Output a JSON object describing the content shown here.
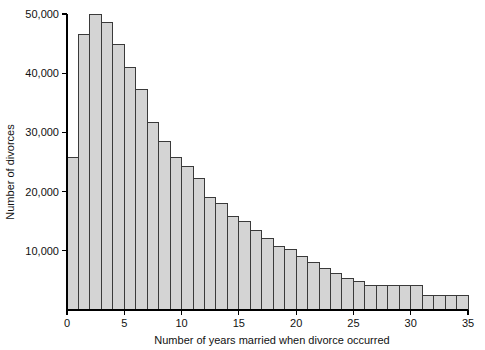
{
  "chart_data": {
    "type": "bar",
    "title": "",
    "subtitle": "",
    "xlabel": "Number of years married when divorce occurred",
    "ylabel": "Number of divorces",
    "xlim": [
      0,
      35
    ],
    "ylim": [
      0,
      50000
    ],
    "grid": false,
    "legend": null,
    "x_ticks": [
      0,
      5,
      10,
      15,
      20,
      25,
      30,
      35
    ],
    "x_tick_labels": [
      "0",
      "5",
      "10",
      "15",
      "20",
      "25",
      "30",
      "35"
    ],
    "y_ticks": [
      10000,
      20000,
      30000,
      40000,
      50000
    ],
    "y_tick_labels": [
      "10,000",
      "20,000",
      "30,000",
      "40,000",
      "50,000"
    ],
    "bar_fill": "#d4d4d4",
    "bar_edge": "#3a3a3a",
    "bins": [
      {
        "start": 0,
        "end": 1,
        "value": 25800
      },
      {
        "start": 1,
        "end": 2,
        "value": 46500
      },
      {
        "start": 2,
        "end": 3,
        "value": 50000
      },
      {
        "start": 3,
        "end": 4,
        "value": 48600
      },
      {
        "start": 4,
        "end": 5,
        "value": 44800
      },
      {
        "start": 5,
        "end": 6,
        "value": 41000
      },
      {
        "start": 6,
        "end": 7,
        "value": 37200
      },
      {
        "start": 7,
        "end": 8,
        "value": 31700
      },
      {
        "start": 8,
        "end": 9,
        "value": 28500
      },
      {
        "start": 9,
        "end": 10,
        "value": 25700
      },
      {
        "start": 10,
        "end": 11,
        "value": 24200
      },
      {
        "start": 11,
        "end": 12,
        "value": 22200
      },
      {
        "start": 12,
        "end": 13,
        "value": 19000
      },
      {
        "start": 13,
        "end": 14,
        "value": 18000
      },
      {
        "start": 14,
        "end": 15,
        "value": 15800
      },
      {
        "start": 15,
        "end": 16,
        "value": 14900
      },
      {
        "start": 16,
        "end": 17,
        "value": 13400
      },
      {
        "start": 17,
        "end": 18,
        "value": 12000
      },
      {
        "start": 18,
        "end": 19,
        "value": 10800
      },
      {
        "start": 19,
        "end": 20,
        "value": 10200
      },
      {
        "start": 20,
        "end": 21,
        "value": 9000
      },
      {
        "start": 21,
        "end": 22,
        "value": 8000
      },
      {
        "start": 22,
        "end": 23,
        "value": 7000
      },
      {
        "start": 23,
        "end": 24,
        "value": 6200
      },
      {
        "start": 24,
        "end": 25,
        "value": 5400
      },
      {
        "start": 25,
        "end": 26,
        "value": 4800
      },
      {
        "start": 26,
        "end": 27,
        "value": 4100
      },
      {
        "start": 27,
        "end": 28,
        "value": 4100
      },
      {
        "start": 28,
        "end": 29,
        "value": 4100
      },
      {
        "start": 29,
        "end": 30,
        "value": 4100
      },
      {
        "start": 30,
        "end": 31,
        "value": 4100
      },
      {
        "start": 31,
        "end": 32,
        "value": 2400
      },
      {
        "start": 32,
        "end": 33,
        "value": 2400
      },
      {
        "start": 33,
        "end": 34,
        "value": 2400
      },
      {
        "start": 34,
        "end": 35,
        "value": 2400
      }
    ]
  }
}
